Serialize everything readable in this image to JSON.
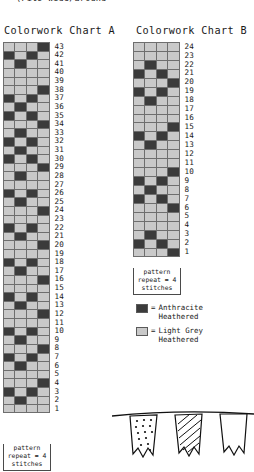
{
  "page": {
    "top_caption": "(Fits wide/around"
  },
  "colors": {
    "dark": "#3b3b3b",
    "light": "#c9c9c9",
    "grid_line": "#6e6e6e",
    "text": "#1a1a1a",
    "background": "#ffffff"
  },
  "chart_a": {
    "title": "Colorwork Chart A",
    "columns": 4,
    "rows": 43,
    "repeat_label": "pattern\nrepeat =\n4 stitches",
    "row_numbers": [
      43,
      42,
      41,
      40,
      39,
      38,
      37,
      36,
      35,
      34,
      33,
      32,
      31,
      30,
      29,
      28,
      27,
      26,
      25,
      24,
      23,
      22,
      21,
      20,
      19,
      18,
      17,
      16,
      15,
      14,
      13,
      12,
      11,
      10,
      9,
      8,
      7,
      6,
      5,
      4,
      3,
      2,
      1
    ],
    "rows_top_to_bottom": [
      [
        "l",
        "l",
        "l",
        "d"
      ],
      [
        "d",
        "l",
        "d",
        "l"
      ],
      [
        "l",
        "d",
        "l",
        "l"
      ],
      [
        "l",
        "l",
        "l",
        "l"
      ],
      [
        "l",
        "l",
        "l",
        "l"
      ],
      [
        "l",
        "l",
        "l",
        "d"
      ],
      [
        "d",
        "l",
        "d",
        "l"
      ],
      [
        "l",
        "d",
        "l",
        "l"
      ],
      [
        "d",
        "l",
        "d",
        "l"
      ],
      [
        "l",
        "l",
        "l",
        "d"
      ],
      [
        "l",
        "d",
        "l",
        "l"
      ],
      [
        "d",
        "l",
        "d",
        "l"
      ],
      [
        "l",
        "d",
        "l",
        "l"
      ],
      [
        "d",
        "l",
        "d",
        "l"
      ],
      [
        "l",
        "l",
        "l",
        "d"
      ],
      [
        "l",
        "d",
        "l",
        "l"
      ],
      [
        "l",
        "l",
        "l",
        "l"
      ],
      [
        "d",
        "l",
        "d",
        "l"
      ],
      [
        "l",
        "d",
        "l",
        "l"
      ],
      [
        "l",
        "l",
        "l",
        "d"
      ],
      [
        "l",
        "l",
        "l",
        "l"
      ],
      [
        "d",
        "l",
        "d",
        "l"
      ],
      [
        "l",
        "d",
        "l",
        "l"
      ],
      [
        "l",
        "l",
        "l",
        "d"
      ],
      [
        "l",
        "l",
        "l",
        "l"
      ],
      [
        "d",
        "l",
        "d",
        "l"
      ],
      [
        "l",
        "d",
        "l",
        "l"
      ],
      [
        "l",
        "l",
        "l",
        "d"
      ],
      [
        "l",
        "l",
        "l",
        "l"
      ],
      [
        "d",
        "l",
        "d",
        "l"
      ],
      [
        "l",
        "d",
        "l",
        "l"
      ],
      [
        "l",
        "l",
        "l",
        "d"
      ],
      [
        "l",
        "l",
        "l",
        "l"
      ],
      [
        "d",
        "l",
        "d",
        "l"
      ],
      [
        "l",
        "d",
        "l",
        "l"
      ],
      [
        "l",
        "l",
        "l",
        "d"
      ],
      [
        "d",
        "l",
        "d",
        "l"
      ],
      [
        "l",
        "d",
        "l",
        "l"
      ],
      [
        "l",
        "l",
        "l",
        "l"
      ],
      [
        "l",
        "l",
        "l",
        "d"
      ],
      [
        "d",
        "l",
        "d",
        "l"
      ],
      [
        "l",
        "d",
        "l",
        "l"
      ],
      [
        "l",
        "l",
        "l",
        "l"
      ]
    ]
  },
  "chart_b": {
    "title": "Colorwork Chart B",
    "columns": 4,
    "rows": 24,
    "repeat_label": "pattern\nrepeat =\n4 stitches",
    "row_numbers": [
      24,
      23,
      22,
      21,
      20,
      19,
      18,
      17,
      16,
      15,
      14,
      13,
      12,
      11,
      10,
      9,
      8,
      7,
      6,
      5,
      4,
      3,
      2,
      1
    ],
    "rows_top_to_bottom": [
      [
        "l",
        "l",
        "l",
        "l"
      ],
      [
        "l",
        "l",
        "l",
        "l"
      ],
      [
        "l",
        "d",
        "l",
        "l"
      ],
      [
        "d",
        "l",
        "d",
        "l"
      ],
      [
        "l",
        "l",
        "l",
        "d"
      ],
      [
        "d",
        "l",
        "d",
        "l"
      ],
      [
        "l",
        "d",
        "l",
        "l"
      ],
      [
        "l",
        "l",
        "l",
        "l"
      ],
      [
        "l",
        "l",
        "l",
        "l"
      ],
      [
        "l",
        "l",
        "l",
        "d"
      ],
      [
        "d",
        "l",
        "d",
        "l"
      ],
      [
        "l",
        "d",
        "l",
        "l"
      ],
      [
        "l",
        "l",
        "l",
        "l"
      ],
      [
        "l",
        "l",
        "l",
        "l"
      ],
      [
        "l",
        "l",
        "l",
        "d"
      ],
      [
        "d",
        "l",
        "d",
        "l"
      ],
      [
        "l",
        "d",
        "l",
        "l"
      ],
      [
        "d",
        "l",
        "d",
        "l"
      ],
      [
        "l",
        "l",
        "l",
        "d"
      ],
      [
        "l",
        "l",
        "l",
        "l"
      ],
      [
        "l",
        "l",
        "l",
        "l"
      ],
      [
        "l",
        "d",
        "l",
        "l"
      ],
      [
        "d",
        "l",
        "d",
        "l"
      ],
      [
        "l",
        "l",
        "l",
        "d"
      ]
    ]
  },
  "legend": {
    "items": [
      {
        "swatch": "dark",
        "equals": "=",
        "label": "Anthracite\nHeathered"
      },
      {
        "swatch": "light",
        "equals": "=",
        "label": "Light Grey\nHeathered"
      }
    ]
  },
  "illustration": {
    "name": "bunting-flags"
  }
}
